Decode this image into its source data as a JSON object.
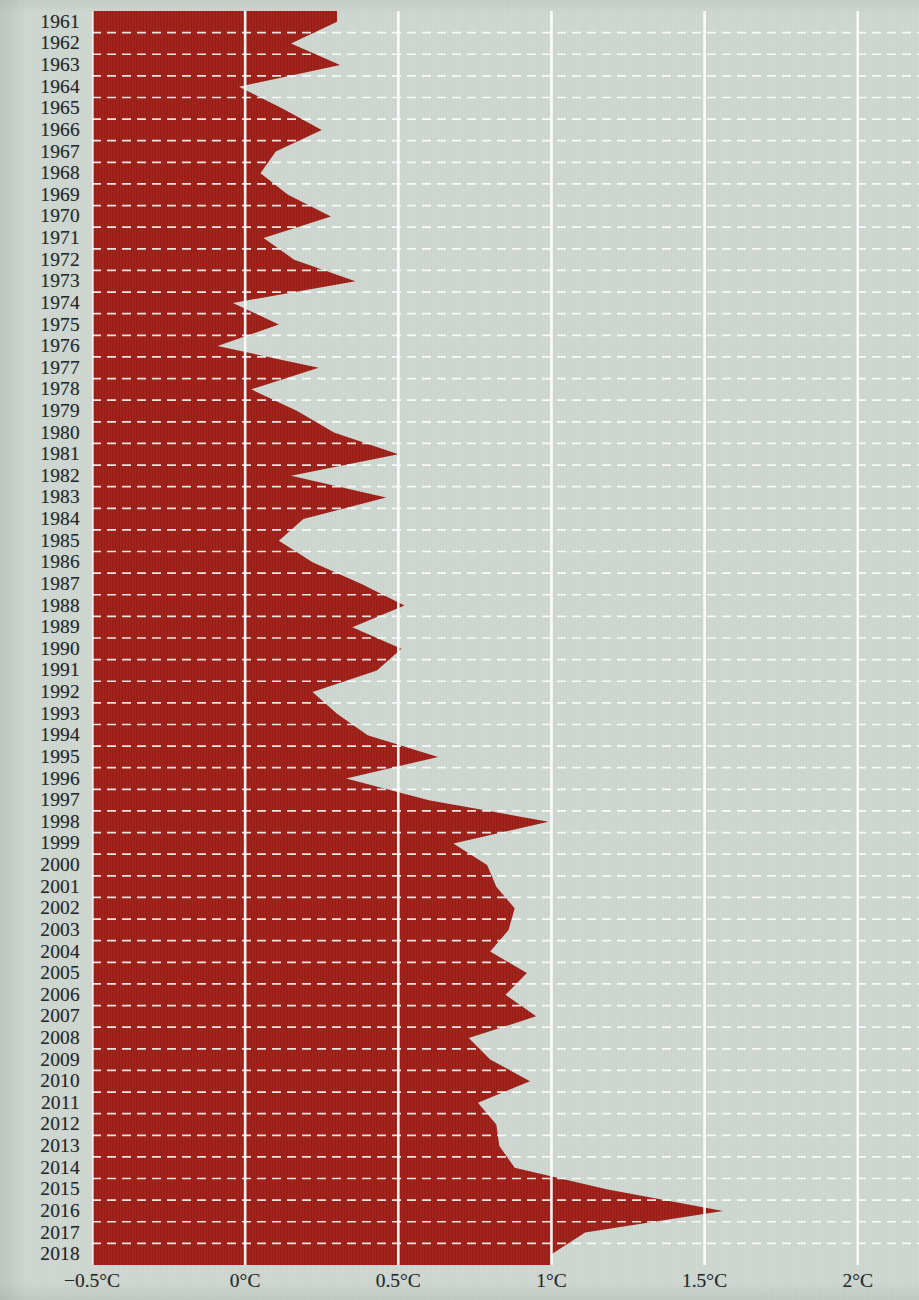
{
  "chart_data": {
    "type": "area",
    "orientation": "horizontal",
    "title": "",
    "subtitle": "",
    "xlabel": "",
    "ylabel": "",
    "xlim": [
      -0.5,
      2.2
    ],
    "ylim": [
      1961,
      2018
    ],
    "grid": true,
    "legend": null,
    "units": "°C",
    "baseline": -0.5,
    "x_tick_values": [
      -0.5,
      0,
      0.5,
      1,
      1.5,
      2
    ],
    "x_tick_labels": [
      "−0.5°C",
      "0°C",
      "0.5°C",
      "1°C",
      "1.5°C",
      "2°C"
    ],
    "categories": [
      "1961",
      "1962",
      "1963",
      "1964",
      "1965",
      "1966",
      "1967",
      "1968",
      "1969",
      "1970",
      "1971",
      "1972",
      "1973",
      "1974",
      "1975",
      "1976",
      "1977",
      "1978",
      "1979",
      "1980",
      "1981",
      "1982",
      "1983",
      "1984",
      "1985",
      "1986",
      "1987",
      "1988",
      "1989",
      "1990",
      "1991",
      "1992",
      "1993",
      "1994",
      "1995",
      "1996",
      "1997",
      "1998",
      "1999",
      "2000",
      "2001",
      "2002",
      "2003",
      "2004",
      "2005",
      "2006",
      "2007",
      "2008",
      "2009",
      "2010",
      "2011",
      "2012",
      "2013",
      "2014",
      "2015",
      "2016",
      "2017",
      "2018"
    ],
    "values": [
      0.3,
      0.15,
      0.31,
      -0.02,
      0.12,
      0.25,
      0.1,
      0.05,
      0.14,
      0.28,
      0.06,
      0.16,
      0.36,
      -0.04,
      0.11,
      -0.09,
      0.24,
      0.02,
      0.17,
      0.29,
      0.5,
      0.15,
      0.46,
      0.19,
      0.11,
      0.22,
      0.38,
      0.52,
      0.35,
      0.51,
      0.43,
      0.22,
      0.3,
      0.4,
      0.63,
      0.33,
      0.6,
      0.99,
      0.68,
      0.79,
      0.82,
      0.88,
      0.86,
      0.8,
      0.92,
      0.85,
      0.95,
      0.73,
      0.8,
      0.93,
      0.76,
      0.82,
      0.83,
      0.88,
      1.18,
      1.56,
      1.11,
      1.0
    ],
    "colors": {
      "area": "#9c1c14",
      "background": "#ced6d0",
      "gridline": "#ffffff",
      "row_dash": "#ffffff",
      "text": "#1d2326"
    }
  },
  "axes": {
    "year_axis_name": "year-axis",
    "x_axis_name": "temperature-axis"
  }
}
